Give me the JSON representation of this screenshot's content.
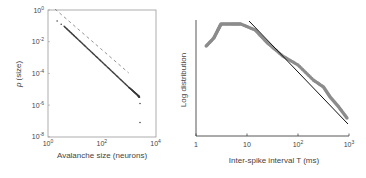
{
  "chart_data": [
    {
      "type": "scatter",
      "title": "",
      "xlabel": "Avalanche size (neurons)",
      "ylabel": "p (size)",
      "xscale": "log",
      "yscale": "log",
      "xlim": [
        1,
        10000
      ],
      "ylim": [
        1e-08,
        1
      ],
      "x_ticks": [
        {
          "base": "10",
          "exp": "0"
        },
        {
          "base": "10",
          "exp": "2"
        },
        {
          "base": "10",
          "exp": "4"
        }
      ],
      "y_ticks": [
        {
          "base": "10",
          "exp": "0"
        },
        {
          "base": "10",
          "exp": "-2"
        },
        {
          "base": "10",
          "exp": "-4"
        },
        {
          "base": "10",
          "exp": "-6"
        },
        {
          "base": "10",
          "exp": "-8"
        }
      ],
      "frame": "box",
      "grid": false,
      "series": [
        {
          "name": "avalanche size distribution",
          "style": "dots",
          "color": "#3a3a3a",
          "points_log10": [
            [
              0.34,
              -0.7
            ],
            [
              0.49,
              -0.9
            ],
            [
              0.6,
              -1.03
            ],
            [
              1.0,
              -1.67
            ],
            [
              1.5,
              -2.47
            ],
            [
              2.0,
              -3.27
            ],
            [
              2.5,
              -4.07
            ],
            [
              3.0,
              -4.87
            ],
            [
              3.2,
              -5.17
            ],
            [
              3.35,
              -5.4
            ],
            [
              3.4,
              -5.5
            ],
            [
              3.42,
              -5.9
            ],
            [
              3.42,
              -7.1
            ]
          ]
        },
        {
          "name": "power-law reference",
          "style": "dashed",
          "color": "#777777",
          "points_log10": [
            [
              0.26,
              0.06
            ],
            [
              3.0,
              -3.97
            ]
          ]
        }
      ]
    },
    {
      "type": "line",
      "title": "",
      "xlabel": "Inter-spike interval T (ms)",
      "ylabel": "Log distribution",
      "xscale": "log",
      "xlim": [
        1,
        1000
      ],
      "x_ticks": [
        "1",
        "10",
        {
          "base": "10",
          "exp": "2"
        },
        {
          "base": "10",
          "exp": "3"
        }
      ],
      "y_ticks": [],
      "frame": "L-axes",
      "grid": false,
      "series": [
        {
          "name": "ISI distribution",
          "style": "thick-grey-dots",
          "color": "#8c8c8c",
          "points_log10x_relY": [
            [
              0.2,
              9.0
            ],
            [
              0.35,
              9.8
            ],
            [
              0.43,
              10.6
            ],
            [
              0.49,
              11.2
            ],
            [
              0.7,
              11.2
            ],
            [
              0.88,
              11.2
            ],
            [
              1.16,
              10.6
            ],
            [
              1.4,
              9.3
            ],
            [
              1.7,
              8.0
            ],
            [
              2.0,
              7.1
            ],
            [
              2.3,
              5.6
            ],
            [
              2.5,
              4.9
            ],
            [
              2.63,
              3.9
            ],
            [
              2.8,
              2.9
            ],
            [
              2.96,
              1.8
            ]
          ]
        },
        {
          "name": "power-law fit",
          "style": "solid",
          "color": "#111111",
          "points_log10x_relY": [
            [
              1.04,
              11.5
            ],
            [
              2.98,
              1.2
            ]
          ]
        }
      ]
    }
  ]
}
